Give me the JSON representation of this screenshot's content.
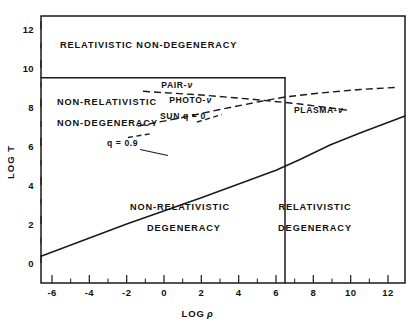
{
  "figure": {
    "axes": {
      "x": {
        "title": "LOG",
        "title_symbol": "ρ",
        "ticks": [
          -6,
          -4,
          -2,
          0,
          2,
          4,
          6,
          8,
          10,
          12
        ],
        "tick_labels": [
          "-6",
          "-4",
          "-2",
          "0",
          "2",
          "4",
          "6",
          "8",
          "10",
          "12"
        ],
        "minor_ticks": [
          -5,
          -3,
          -1,
          1,
          3,
          5,
          7,
          9,
          11
        ],
        "range": [
          -7,
          13
        ]
      },
      "y": {
        "title": "LOG T",
        "ticks": [
          0,
          2,
          4,
          6,
          8,
          10,
          12
        ],
        "tick_labels": [
          "0",
          "2",
          "4",
          "6",
          "8",
          "10",
          "12"
        ],
        "minor_ticks": [
          1,
          3,
          5,
          7,
          9,
          11
        ],
        "range": [
          -0.6,
          13
        ]
      }
    },
    "regions": [
      {
        "id": "relativistic-non-degeneracy",
        "lines": [
          "RELATIVISTIC NON-DEGENERACY"
        ],
        "x": 1.0,
        "y": 11.6
      },
      {
        "id": "non-relativistic-non-degeneracy",
        "lines": [
          "NON-RELATIVISTIC",
          "NON-DEGENERACY"
        ],
        "x": -5.3,
        "y": 8.3
      },
      {
        "id": "non-relativistic-degeneracy",
        "lines": [
          "NON-RELATIVISTIC",
          "DEGENERACY"
        ],
        "x": 0.6,
        "y": 3.0
      },
      {
        "id": "relativistic-degeneracy",
        "lines": [
          "RELATIVISTIC",
          "DEGENERACY"
        ],
        "x": 8.4,
        "y": 3.0
      }
    ],
    "curves": [
      {
        "id": "degeneracy-boundary",
        "style": "solid",
        "label": "q = 0.9",
        "points": [
          [
            -7,
            0.35
          ],
          [
            -2,
            2.0
          ],
          [
            2,
            3.35
          ],
          [
            4,
            4.05
          ],
          [
            6,
            4.75
          ],
          [
            8,
            5.6
          ],
          [
            10,
            6.4
          ],
          [
            13,
            7.5
          ]
        ]
      },
      {
        "id": "relativistic-boundary",
        "style": "solid",
        "points": [
          [
            -7,
            9.5
          ],
          [
            6.3,
            9.5
          ]
        ]
      },
      {
        "id": "relativistic-degeneracy-boundary",
        "style": "solid",
        "points": [
          [
            6.3,
            9.5
          ],
          [
            6.3,
            -0.6
          ]
        ]
      },
      {
        "id": "pair-neutrino",
        "style": "dashed",
        "label": "PAIR-",
        "symbol": "ν",
        "points": [
          [
            -1.5,
            9.0
          ],
          [
            4.5,
            8.8
          ],
          [
            9.2,
            8.2
          ]
        ]
      },
      {
        "id": "photo-neutrino",
        "style": "dashed",
        "label": "PHOTO-",
        "symbol": "ν",
        "points": [
          [
            -1.8,
            7.0
          ],
          [
            2.5,
            7.6
          ],
          [
            6.3,
            8.35
          ],
          [
            11.0,
            8.75
          ]
        ]
      },
      {
        "id": "plasma-neutrino",
        "style": "dashed",
        "label": "PLASMA-",
        "symbol": "ν"
      },
      {
        "id": "sun",
        "style": "dashed-leader",
        "label": "SUN q",
        "value": "= 0"
      }
    ],
    "annotations": [
      {
        "id": "q-0-9",
        "text": "q = 0.9",
        "x": -0.9,
        "y": 5.35
      },
      {
        "id": "sun-q-0",
        "text": "SUN q = 0",
        "x": 0.9,
        "y": 7.05
      },
      {
        "id": "pair-nu",
        "text": "PAIR-",
        "symbol": "ν",
        "x": 0.8,
        "y": 9.35
      },
      {
        "id": "photo-nu",
        "text": "PHOTO-",
        "symbol": "ν",
        "x": 1.6,
        "y": 8.6
      },
      {
        "id": "plasma-nu",
        "text": "PLASMA-",
        "symbol": "ν",
        "x": 7.0,
        "y": 8.1
      }
    ]
  }
}
